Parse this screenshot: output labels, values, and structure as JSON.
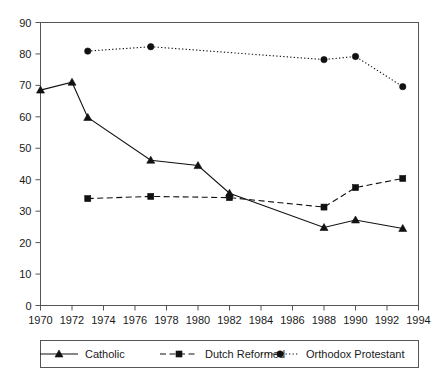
{
  "title": "",
  "chart_data": {
    "type": "line",
    "title": "",
    "subtitle": "",
    "xlabel": "",
    "ylabel": "",
    "xlim": [
      1970,
      1994
    ],
    "ylim": [
      0,
      90
    ],
    "xticks": [
      1970,
      1972,
      1974,
      1976,
      1978,
      1980,
      1982,
      1984,
      1986,
      1988,
      1990,
      1992,
      1994
    ],
    "yticks": [
      0,
      10,
      20,
      30,
      40,
      50,
      60,
      70,
      80,
      90
    ],
    "xtick_labels": [
      "1970",
      "1972",
      "1974",
      "1976",
      "1978",
      "1980",
      "1982",
      "1984",
      "1986",
      "1988",
      "1990",
      "1992",
      "1994"
    ],
    "ytick_labels": [
      "0",
      "10",
      "20",
      "30",
      "40",
      "50",
      "60",
      "70",
      "80",
      "90"
    ],
    "grid": false,
    "legend_position": "below",
    "series": [
      {
        "name": "Catholic",
        "marker": "triangle",
        "linestyle": "solid",
        "color": "#111111",
        "x": [
          1970,
          1972,
          1973,
          1977,
          1980,
          1982,
          1988,
          1990,
          1993
        ],
        "values": [
          68.5,
          71.0,
          59.8,
          46.2,
          44.5,
          35.7,
          24.8,
          27.2,
          24.5
        ]
      },
      {
        "name": "Dutch Reformed",
        "marker": "square",
        "linestyle": "dashed",
        "color": "#111111",
        "x": [
          1973,
          1977,
          1982,
          1988,
          1990,
          1993
        ],
        "values": [
          34.0,
          34.7,
          34.3,
          31.3,
          37.5,
          40.4
        ]
      },
      {
        "name": "Orthodox Protestant",
        "marker": "circle",
        "linestyle": "dotted",
        "color": "#111111",
        "x": [
          1973,
          1977,
          1988,
          1990,
          1993
        ],
        "values": [
          80.9,
          82.3,
          78.2,
          79.2,
          69.6
        ]
      }
    ]
  },
  "legend": {
    "items": [
      {
        "label": "Catholic",
        "marker": "triangle",
        "linestyle": "solid"
      },
      {
        "label": "Dutch Reformed",
        "marker": "square",
        "linestyle": "dashed"
      },
      {
        "label": "Orthodox Protestant",
        "marker": "circle",
        "linestyle": "dotted"
      }
    ]
  }
}
